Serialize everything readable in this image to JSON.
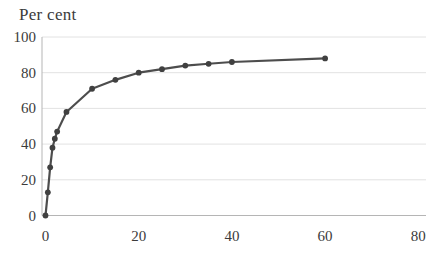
{
  "chart_data": {
    "type": "line",
    "title": "Per cent",
    "xlabel": "",
    "ylabel": "Per cent",
    "points": [
      {
        "x": 0,
        "y": 0
      },
      {
        "x": 0.5,
        "y": 13
      },
      {
        "x": 1,
        "y": 27
      },
      {
        "x": 1.5,
        "y": 38
      },
      {
        "x": 2,
        "y": 43
      },
      {
        "x": 2.5,
        "y": 47
      },
      {
        "x": 4.5,
        "y": 58
      },
      {
        "x": 10,
        "y": 71
      },
      {
        "x": 15,
        "y": 76
      },
      {
        "x": 20,
        "y": 80
      },
      {
        "x": 25,
        "y": 82
      },
      {
        "x": 30,
        "y": 84
      },
      {
        "x": 35,
        "y": 85
      },
      {
        "x": 40,
        "y": 86
      },
      {
        "x": 60,
        "y": 88
      }
    ],
    "x_ticks": [
      0,
      20,
      40,
      60,
      80
    ],
    "y_ticks": [
      0,
      20,
      40,
      60,
      80,
      100
    ],
    "xlim": [
      0,
      80
    ],
    "ylim": [
      0,
      100
    ],
    "grid": "horizontal",
    "legend": "none",
    "marker": "circle",
    "colors": {
      "line": "#4d4d4d",
      "marker": "#404040",
      "gridline": "#e2e2e2",
      "axis": "#b5b5b5",
      "text": "#3b3b3b",
      "background": "#ffffff"
    }
  }
}
